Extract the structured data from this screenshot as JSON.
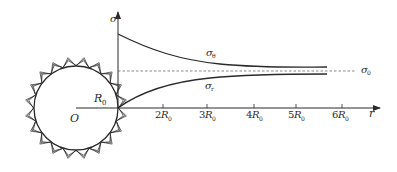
{
  "diagram": {
    "colors": {
      "line": "#2a2a2a",
      "dashed": "#555555",
      "hatch": "#333333",
      "background": "#ffffff"
    },
    "origin_label": "O",
    "radius_label": {
      "main": "R",
      "sub": "0"
    },
    "y_axis_label": "σ",
    "x_axis_label": "r",
    "x_ticks": [
      {
        "coef": "2",
        "main": "R",
        "sub": "0"
      },
      {
        "coef": "3",
        "main": "R",
        "sub": "0"
      },
      {
        "coef": "4",
        "main": "R",
        "sub": "0"
      },
      {
        "coef": "5",
        "main": "R",
        "sub": "0"
      },
      {
        "coef": "6",
        "main": "R",
        "sub": "0"
      }
    ],
    "curves": {
      "sigma_theta": {
        "main": "σ",
        "sub": "θ"
      },
      "sigma_r": {
        "main": "σ",
        "sub": "r"
      }
    },
    "asymptote_label": {
      "main": "σ",
      "sub": "0"
    }
  }
}
